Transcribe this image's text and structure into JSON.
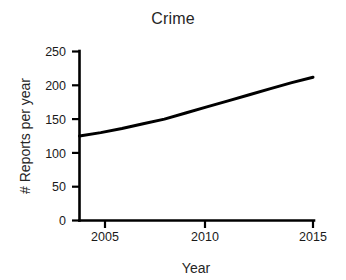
{
  "chart_data": {
    "type": "line",
    "title": "Crime",
    "xlabel": "Year",
    "ylabel": "# Reports per year",
    "xlim": [
      2004,
      2015
    ],
    "ylim": [
      0,
      250
    ],
    "xticks": [
      2005,
      2010,
      2015
    ],
    "yticks": [
      0,
      50,
      100,
      150,
      200,
      250
    ],
    "grid": false,
    "legend": "none",
    "line_color": "#000000",
    "series": [
      {
        "name": "Reports per year",
        "x": [
          2004,
          2005,
          2006,
          2007,
          2008,
          2009,
          2010,
          2011,
          2012,
          2013,
          2014,
          2015
        ],
        "values": [
          125,
          130,
          136,
          143,
          150,
          159,
          168,
          177,
          186,
          195,
          204,
          212
        ]
      }
    ]
  },
  "axes": {
    "x_tick_labels": [
      "2005",
      "2010",
      "2015"
    ],
    "y_tick_labels": [
      "0",
      "50",
      "100",
      "150",
      "200",
      "250"
    ],
    "x_axis_title": "Year",
    "y_axis_title": "# Reports per year"
  },
  "title": "Crime",
  "colors": {
    "background": "#ffffff",
    "foreground": "#000000",
    "text": "#1a1a1a"
  }
}
